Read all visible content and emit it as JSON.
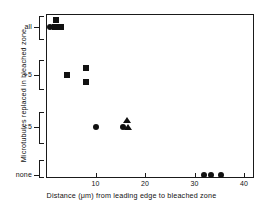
{
  "chart_data": {
    "type": "scatter",
    "title": "",
    "xlabel": "Distance (μm) from leading edge to bleached zone",
    "ylabel": "Microtubules replaced in bleached zone",
    "xlim": [
      0,
      42
    ],
    "ylim_categories": [
      "none",
      "<5",
      ">5",
      "all"
    ],
    "grid": false,
    "legend": "none",
    "xticks": [
      10,
      20,
      30,
      40
    ],
    "xtick_labels": [
      "10",
      "20",
      "30",
      "40"
    ],
    "ycategories": [
      {
        "label": "all",
        "index": 3
      },
      {
        "label": ">5",
        "index": 2
      },
      {
        "label": "<5",
        "index": 1
      },
      {
        "label": "none",
        "index": 0
      }
    ],
    "series": [
      {
        "name": "square-marker",
        "marker": "square",
        "points": [
          {
            "x": 2.0,
            "category": "all",
            "offset": 1
          },
          {
            "x": 1.9,
            "category": "all",
            "offset": 0
          },
          {
            "x": 3.1,
            "category": "all",
            "offset": 0
          },
          {
            "x": 4.3,
            "category": ">5",
            "offset": 0
          },
          {
            "x": 8.0,
            "category": ">5",
            "offset": 1
          },
          {
            "x": 8.0,
            "category": ">5",
            "offset": -1
          }
        ]
      },
      {
        "name": "circle-marker",
        "marker": "circle",
        "points": [
          {
            "x": 0.8,
            "category": "all",
            "offset": 0
          },
          {
            "x": 10.0,
            "category": "<5",
            "offset": 0
          },
          {
            "x": 15.5,
            "category": "<5",
            "offset": 0
          },
          {
            "x": 32.0,
            "category": "none",
            "offset": 0
          },
          {
            "x": 33.4,
            "category": "none",
            "offset": 0
          },
          {
            "x": 35.4,
            "category": "none",
            "offset": 0
          }
        ]
      },
      {
        "name": "triangle-marker",
        "marker": "triangle",
        "points": [
          {
            "x": 16.3,
            "category": "<5",
            "offset": 1
          },
          {
            "x": 16.5,
            "category": "<5",
            "offset": 0
          }
        ]
      }
    ],
    "colors": {
      "marker": "#111111",
      "axis": "#1a1a1a",
      "background": "#ffffff",
      "text": "#111111"
    }
  }
}
